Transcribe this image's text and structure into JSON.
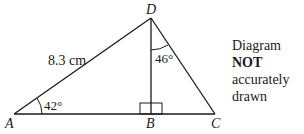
{
  "diagram": {
    "type": "triangle",
    "points": {
      "A": {
        "label": "A",
        "x": 14,
        "y": 114
      },
      "B": {
        "label": "B",
        "x": 151,
        "y": 114
      },
      "C": {
        "label": "C",
        "x": 215,
        "y": 114
      },
      "D": {
        "label": "D",
        "x": 151,
        "y": 18
      }
    },
    "side_AD": "8.3 cm",
    "angle_DAB": "42°",
    "angle_BDC": "46°",
    "right_angle_at": "B",
    "note_line1": "Diagram",
    "note_bold": "NOT",
    "note_line2": "accurately drawn"
  }
}
